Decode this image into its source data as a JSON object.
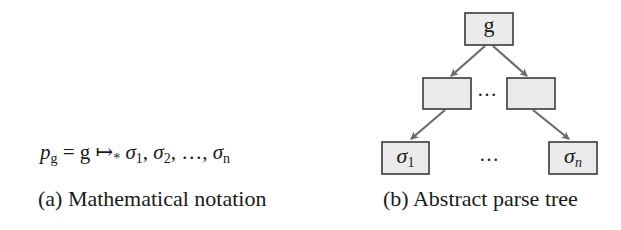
{
  "panel_a": {
    "formula": {
      "lhs_var": "p",
      "lhs_sub": "g",
      "equals": "=",
      "grammar": "g",
      "arrow": "↦",
      "arrow_star": "*",
      "seq": [
        {
          "sym": "σ",
          "sub": "1"
        },
        {
          "sym": "σ",
          "sub": "2"
        },
        {
          "sym": "…",
          "sub": ""
        },
        {
          "sym": "σ",
          "sub": "n"
        }
      ],
      "sep": ","
    },
    "caption": "(a) Mathematical notation"
  },
  "panel_b": {
    "root": {
      "label": "g"
    },
    "middle": [
      {
        "label": ""
      },
      {
        "label": ""
      }
    ],
    "middle_ellipsis": "…",
    "leaves": [
      {
        "sym": "σ",
        "sub": "1"
      },
      {
        "sym": "σ",
        "sub": "n"
      }
    ],
    "leaves_ellipsis": "…",
    "caption": "(b) Abstract parse tree",
    "colors": {
      "node_fill": "#ebebeb",
      "node_stroke": "#3a3a3a",
      "edge": "#6b6b6b"
    }
  }
}
